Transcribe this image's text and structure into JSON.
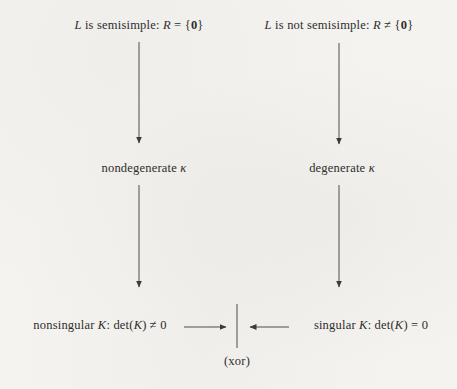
{
  "page": {
    "kind": "scanned textbook diagram",
    "colors": {
      "background": "#f4f3f0",
      "text": "#2e2d2b",
      "line": "#3c3b39"
    }
  },
  "diagram": {
    "nodes": {
      "semisimple": {
        "text": "L is semisimple: R = {0}",
        "segments": [
          {
            "t": "L",
            "i": true
          },
          {
            "t": " is semisimple: "
          },
          {
            "t": "R",
            "i": true
          },
          {
            "t": " = {"
          },
          {
            "t": "0",
            "b": true
          },
          {
            "t": "}"
          }
        ]
      },
      "not_semisimple": {
        "text": "L is not semisimple: R ≠ {0}",
        "segments": [
          {
            "t": "L",
            "i": true
          },
          {
            "t": " is not semisimple: "
          },
          {
            "t": "R",
            "i": true
          },
          {
            "t": " ≠ {"
          },
          {
            "t": "0",
            "b": true
          },
          {
            "t": "}"
          }
        ]
      },
      "nondegenerate_kappa": {
        "text": "nondegenerate κ",
        "segments": [
          {
            "t": "nondegenerate "
          },
          {
            "t": "κ",
            "i": true
          }
        ]
      },
      "degenerate_kappa": {
        "text": "degenerate κ",
        "segments": [
          {
            "t": "degenerate "
          },
          {
            "t": "κ",
            "i": true
          }
        ]
      },
      "nonsingular_K": {
        "text": "nonsingular K: det(K) ≠ 0",
        "segments": [
          {
            "t": "nonsingular "
          },
          {
            "t": "K",
            "i": true
          },
          {
            "t": ": det("
          },
          {
            "t": "K",
            "i": true
          },
          {
            "t": ") ≠ 0"
          }
        ]
      },
      "singular_K": {
        "text": "singular K: det(K) = 0",
        "segments": [
          {
            "t": "singular "
          },
          {
            "t": "K",
            "i": true
          },
          {
            "t": ": det("
          },
          {
            "t": "K",
            "i": true
          },
          {
            "t": ") = 0"
          }
        ]
      }
    },
    "xor_label": "(xor)",
    "edges": [
      {
        "from": "semisimple",
        "to": "nondegenerate_kappa"
      },
      {
        "from": "not_semisimple",
        "to": "degenerate_kappa"
      },
      {
        "from": "nondegenerate_kappa",
        "to": "nonsingular_K"
      },
      {
        "from": "degenerate_kappa",
        "to": "singular_K"
      },
      {
        "from": "nonsingular_K",
        "to": "xor_junction"
      },
      {
        "from": "singular_K",
        "to": "xor_junction"
      }
    ]
  }
}
